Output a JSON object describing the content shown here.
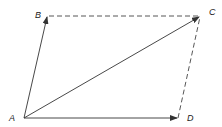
{
  "diagram": {
    "type": "vector parallelogram",
    "points": {
      "A": {
        "label": "A",
        "x": 24,
        "y": 118
      },
      "B": {
        "label": "B",
        "x": 47,
        "y": 16
      },
      "C": {
        "label": "C",
        "x": 200,
        "y": 16
      },
      "D": {
        "label": "D",
        "x": 178,
        "y": 118
      }
    },
    "solid_arrows": [
      "AB",
      "AC",
      "AD"
    ],
    "dashed_lines": [
      "BC",
      "DC"
    ],
    "colors": {
      "line": "#333333",
      "background": "#ffffff"
    }
  }
}
